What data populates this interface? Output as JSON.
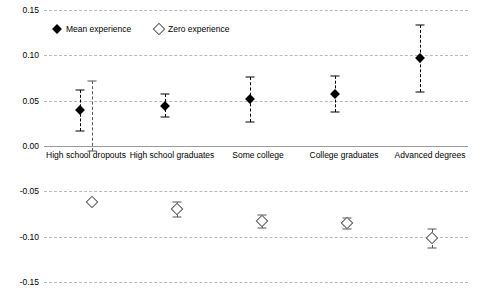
{
  "chart_data": {
    "type": "scatter",
    "title": "",
    "xlabel": "",
    "ylabel": "",
    "ylim": [
      -0.15,
      0.15
    ],
    "yticks": [
      0.15,
      0.1,
      0.05,
      0.0,
      -0.05,
      -0.1,
      -0.15
    ],
    "ytick_labels": [
      "0.15",
      "0.10",
      "0.05",
      "0.00",
      "-0.05",
      "-0.10",
      "-0.15"
    ],
    "grid": true,
    "legend_position": "top-left",
    "categories": [
      "High school dropouts",
      "High school graduates",
      "Some college",
      "College graduates",
      "Advanced degrees"
    ],
    "series": [
      {
        "name": "Mean experience",
        "marker": "filled-diamond",
        "color": "#000000",
        "values": [
          0.04,
          0.044,
          0.052,
          0.057,
          0.097
        ],
        "ci_low": [
          0.016,
          0.032,
          0.027,
          0.038,
          0.06
        ],
        "ci_high": [
          0.062,
          0.057,
          0.076,
          0.077,
          0.133
        ]
      },
      {
        "name": "Zero experience",
        "marker": "open-diamond",
        "color": "#555555",
        "values": [
          -0.062,
          -0.07,
          -0.083,
          -0.085,
          -0.102
        ],
        "ci_low": [
          -0.005,
          -0.078,
          -0.09,
          -0.091,
          -0.112
        ],
        "ci_high": [
          0.072,
          -0.062,
          -0.076,
          -0.079,
          -0.092
        ]
      }
    ]
  },
  "legend": {
    "entries": [
      {
        "label": "Mean experience"
      },
      {
        "label": "Zero experience"
      }
    ]
  }
}
